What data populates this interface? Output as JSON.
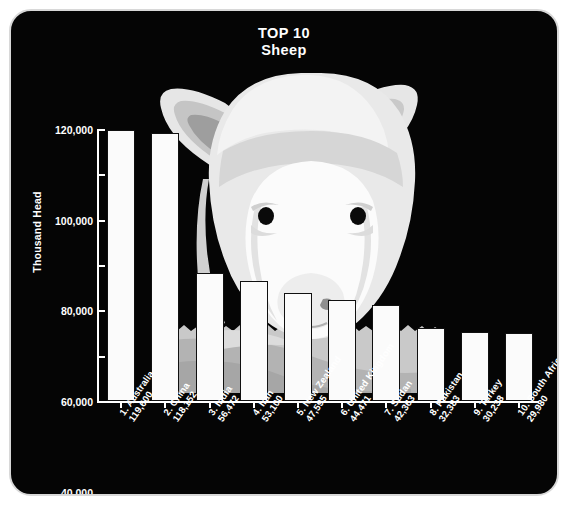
{
  "poster": {
    "title_main": "TOP 10",
    "title_sub": "Sheep",
    "background_color": "#050505",
    "frame_border_color": "#d8d8d8",
    "text_color": "#ffffff",
    "bar_fill_color": "#fbfbfb",
    "bar_outline_color": "#101010",
    "artwork": "sheep-head-illustration"
  },
  "chart_data": {
    "type": "bar",
    "title": "TOP 10 Sheep",
    "xlabel": "",
    "ylabel": "Thousand Head",
    "ylim": [
      0,
      120000
    ],
    "yticks": [
      0,
      20000,
      40000,
      60000,
      80000,
      100000,
      120000
    ],
    "ytick_labels": [
      "0",
      "20,000",
      "40,000",
      "60,000",
      "80,000",
      "100,000",
      "120,000"
    ],
    "grid": false,
    "legend": "none",
    "categories": [
      "1. Australia",
      "2. China",
      "3. India",
      "4. Iran",
      "5. New Zealand",
      "6. United Kingdom",
      "7. Sudan",
      "8. Pakistan",
      "9. Turkey",
      "10. South Africa"
    ],
    "values": [
      119600,
      118152,
      56472,
      53100,
      47595,
      44471,
      42363,
      32383,
      30238,
      29980
    ],
    "value_labels": [
      "119,600",
      "118,152",
      "56,472",
      "53,100",
      "47,595",
      "44,471",
      "42,363",
      "32,383",
      "30,238",
      "29,980"
    ],
    "bars": [
      {
        "rank": "1.",
        "country": "Australia",
        "value": 119600,
        "value_label": "119,600"
      },
      {
        "rank": "2.",
        "country": "China",
        "value": 118152,
        "value_label": "118,152"
      },
      {
        "rank": "3.",
        "country": "India",
        "value": 56472,
        "value_label": "56,472"
      },
      {
        "rank": "4.",
        "country": "Iran",
        "value": 53100,
        "value_label": "53,100"
      },
      {
        "rank": "5.",
        "country": "New Zealand",
        "value": 47595,
        "value_label": "47,595"
      },
      {
        "rank": "6.",
        "country": "United Kingdom",
        "value": 44471,
        "value_label": "44,471"
      },
      {
        "rank": "7.",
        "country": "Sudan",
        "value": 42363,
        "value_label": "42,363"
      },
      {
        "rank": "8.",
        "country": "Pakistan",
        "value": 32383,
        "value_label": "32,383"
      },
      {
        "rank": "9.",
        "country": "Turkey",
        "value": 30238,
        "value_label": "30,238"
      },
      {
        "rank": "10.",
        "country": "South Africa",
        "value": 29980,
        "value_label": "29,980"
      }
    ]
  }
}
